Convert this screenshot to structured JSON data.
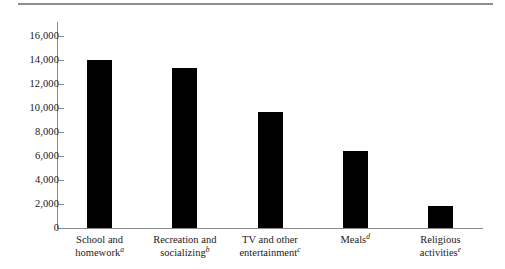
{
  "chart_data": {
    "type": "bar",
    "title": "",
    "subtitle": "",
    "xlabel": "",
    "ylabel": "",
    "ylim": [
      0,
      16000
    ],
    "ytick_values": [
      0,
      2000,
      4000,
      6000,
      8000,
      10000,
      12000,
      14000,
      16000
    ],
    "ytick_labels": [
      "0",
      "2,000",
      "4,000",
      "6,000",
      "8,000",
      "10,000",
      "12,000",
      "14,000",
      "16,000"
    ],
    "grid": false,
    "legend": "none",
    "bar_color": "#000000",
    "axis_color": "#8a8a8a",
    "categories": [
      "School and homework",
      "Recreation and socializing",
      "TV and other entertainment",
      "Meals",
      "Religious activities"
    ],
    "category_lines": [
      [
        "School and",
        "homework"
      ],
      [
        "Recreation and",
        "socializing"
      ],
      [
        "TV and other",
        "entertainment"
      ],
      [
        "Meals",
        ""
      ],
      [
        "Religious",
        "activities"
      ]
    ],
    "footnote_markers": [
      "a",
      "b",
      "c",
      "d",
      "e"
    ],
    "values": [
      14000,
      13300,
      9650,
      6400,
      1850
    ]
  },
  "decor": {
    "top_rule": "horizontal-rule"
  }
}
